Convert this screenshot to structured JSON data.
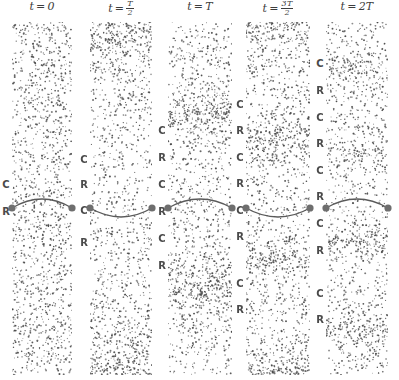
{
  "figure": {
    "width": 399,
    "height": 380,
    "background": "#ffffff",
    "dot_color": "#4a4a4a",
    "label_color": "#4a4a4a",
    "curve_color": "#5a5a5a",
    "node_color": "#6e6e6e"
  },
  "columns": [
    {
      "id": "col-0",
      "title_prefix": "t",
      "title_op": "=",
      "title_value": "0",
      "title_is_fraction": false,
      "x": 12,
      "width": 60,
      "top": 22,
      "bottom": 375,
      "curve_y": 208,
      "curve_direction": "up",
      "density": 0.62,
      "labels": [
        {
          "text": "C",
          "y": 185
        },
        {
          "text": "R",
          "y": 212
        }
      ]
    },
    {
      "id": "col-1",
      "title_prefix": "t",
      "title_op": "=",
      "title_value": "T/2",
      "title_is_fraction": true,
      "title_numerator": "T",
      "title_denominator": "2",
      "x": 90,
      "width": 62,
      "top": 22,
      "bottom": 375,
      "curve_y": 208,
      "curve_direction": "down",
      "density": 0.62,
      "labels": [
        {
          "text": "C",
          "y": 160
        },
        {
          "text": "R",
          "y": 185
        },
        {
          "text": "C",
          "y": 211
        },
        {
          "text": "R",
          "y": 243
        }
      ]
    },
    {
      "id": "col-2",
      "title_prefix": "t",
      "title_op": "=",
      "title_value": "T",
      "title_is_fraction": false,
      "x": 168,
      "width": 64,
      "top": 22,
      "bottom": 375,
      "curve_y": 208,
      "curve_direction": "up",
      "density": 0.66,
      "labels": [
        {
          "text": "C",
          "y": 131
        },
        {
          "text": "R",
          "y": 158
        },
        {
          "text": "C",
          "y": 185
        },
        {
          "text": "R",
          "y": 212
        },
        {
          "text": "C",
          "y": 239
        },
        {
          "text": "R",
          "y": 266
        }
      ]
    },
    {
      "id": "col-3",
      "title_prefix": "t",
      "title_op": "=",
      "title_value": "3T/2",
      "title_is_fraction": true,
      "title_numerator": "3T",
      "title_denominator": "2",
      "x": 246,
      "width": 64,
      "top": 22,
      "bottom": 375,
      "curve_y": 208,
      "curve_direction": "down",
      "density": 0.7,
      "labels": [
        {
          "text": "C",
          "y": 105
        },
        {
          "text": "R",
          "y": 131
        },
        {
          "text": "C",
          "y": 158
        },
        {
          "text": "R",
          "y": 184
        },
        {
          "text": "C",
          "y": 211
        },
        {
          "text": "R",
          "y": 237
        },
        {
          "text": "C",
          "y": 284
        },
        {
          "text": "R",
          "y": 310
        }
      ]
    },
    {
      "id": "col-4",
      "title_prefix": "t",
      "title_op": "=",
      "title_value": "2T",
      "title_is_fraction": false,
      "x": 326,
      "width": 62,
      "top": 22,
      "bottom": 375,
      "curve_y": 208,
      "curve_direction": "up",
      "density": 0.62,
      "labels": [
        {
          "text": "C",
          "y": 64
        },
        {
          "text": "R",
          "y": 91
        },
        {
          "text": "C",
          "y": 118
        },
        {
          "text": "R",
          "y": 144
        },
        {
          "text": "C",
          "y": 171
        },
        {
          "text": "R",
          "y": 197
        },
        {
          "text": "C",
          "y": 224
        },
        {
          "text": "R",
          "y": 251
        },
        {
          "text": "C",
          "y": 294
        },
        {
          "text": "R",
          "y": 320
        }
      ]
    }
  ],
  "chart_data": {
    "type": "scatter",
    "xlabel": "",
    "ylabel": "",
    "grid": false,
    "legend": "none",
    "categories": [
      "t = 0",
      "t = T/2",
      "t = T",
      "t = 3T/2",
      "t = 2T"
    ],
    "series": [
      {
        "name": "compression-bands-count",
        "values": [
          1,
          2,
          3,
          4,
          5
        ]
      },
      {
        "name": "rarefaction-bands-count",
        "values": [
          1,
          2,
          3,
          4,
          5
        ]
      }
    ],
    "annotations": [
      {
        "column": "t = 0",
        "marks": [
          "C",
          "R"
        ]
      },
      {
        "column": "t = T/2",
        "marks": [
          "C",
          "R",
          "C",
          "R"
        ]
      },
      {
        "column": "t = T",
        "marks": [
          "C",
          "R",
          "C",
          "R",
          "C",
          "R"
        ]
      },
      {
        "column": "t = 3T/2",
        "marks": [
          "C",
          "R",
          "C",
          "R",
          "C",
          "R",
          "C",
          "R"
        ]
      },
      {
        "column": "t = 2T",
        "marks": [
          "C",
          "R",
          "C",
          "R",
          "C",
          "R",
          "C",
          "R",
          "C",
          "R"
        ]
      }
    ]
  }
}
